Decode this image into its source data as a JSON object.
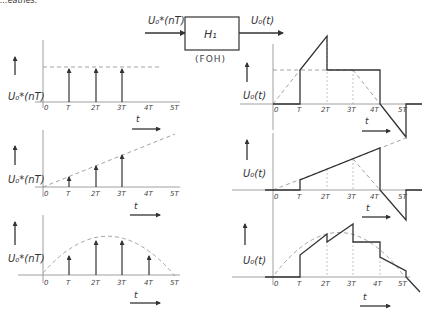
{
  "header_fragment": "...eathes.",
  "block": {
    "input_label": "U₀*(nT)",
    "output_label": "U₀(t)",
    "block_label": "H₁",
    "block_caption": "(FOH)"
  },
  "ticks": [
    "0",
    "T",
    "2T",
    "3T",
    "4T",
    "5T"
  ],
  "time_axis_label": "t",
  "left_column": {
    "ylabel": "U₀*(nT)",
    "plots": [
      {
        "name": "constant",
        "samples": [
          1,
          1,
          1
        ],
        "sample_times": [
          "T",
          "2T",
          "3T"
        ]
      },
      {
        "name": "ramp",
        "samples": [
          0.33,
          0.67,
          1.0
        ],
        "sample_times": [
          "T",
          "2T",
          "3T"
        ]
      },
      {
        "name": "sine-arc",
        "samples": [
          0.55,
          0.95,
          0.95,
          0.55
        ],
        "sample_times": [
          "T",
          "2T",
          "3T",
          "4T"
        ]
      }
    ]
  },
  "right_column": {
    "ylabel": "U₀(t)",
    "plots": [
      {
        "name": "FOH response to constant"
      },
      {
        "name": "FOH response to ramp"
      },
      {
        "name": "FOH response to sine-arc"
      }
    ]
  },
  "colors": {
    "line": "#333333",
    "axis": "#888888",
    "dashed": "#999999"
  }
}
